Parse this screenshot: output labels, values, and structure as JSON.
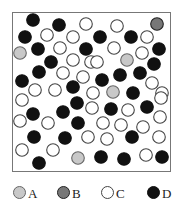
{
  "legend": [
    {
      "key": "A",
      "label": "A",
      "fill": "#c8c8c8",
      "stroke": "#666666"
    },
    {
      "key": "B",
      "label": "B",
      "fill": "#777777",
      "stroke": "#222222"
    },
    {
      "key": "C",
      "label": "C",
      "fill": "#ffffff",
      "stroke": "#444444"
    },
    {
      "key": "D",
      "label": "D",
      "fill": "#111111",
      "stroke": "#111111"
    }
  ],
  "particles": [
    [
      "D",
      33,
      20
    ],
    [
      "D",
      59,
      25
    ],
    [
      "C",
      86,
      24
    ],
    [
      "C",
      117,
      26
    ],
    [
      "B",
      157,
      24
    ],
    [
      "D",
      25,
      37
    ],
    [
      "C",
      47,
      35
    ],
    [
      "C",
      73,
      37
    ],
    [
      "D",
      100,
      37
    ],
    [
      "D",
      131,
      37
    ],
    [
      "C",
      147,
      37
    ],
    [
      "D",
      38,
      49
    ],
    [
      "C",
      60,
      48
    ],
    [
      "D",
      86,
      49
    ],
    [
      "C",
      114,
      48
    ],
    [
      "C",
      142,
      53
    ],
    [
      "D",
      159,
      49
    ],
    [
      "A",
      20,
      53
    ],
    [
      "D",
      51,
      62
    ],
    [
      "C",
      73,
      60
    ],
    [
      "C",
      91,
      62
    ],
    [
      "C",
      97,
      62
    ],
    [
      "A",
      127,
      60
    ],
    [
      "D",
      154,
      64
    ],
    [
      "D",
      39,
      72
    ],
    [
      "C",
      63,
      73
    ],
    [
      "C",
      83,
      77
    ],
    [
      "D",
      120,
      75
    ],
    [
      "D",
      140,
      73
    ],
    [
      "D",
      22,
      81
    ],
    [
      "D",
      102,
      80
    ],
    [
      "C",
      152,
      83
    ],
    [
      "C",
      35,
      90
    ],
    [
      "C",
      55,
      90
    ],
    [
      "D",
      73,
      87
    ],
    [
      "A",
      113,
      92
    ],
    [
      "D",
      133,
      93
    ],
    [
      "C",
      162,
      93
    ],
    [
      "C",
      22,
      100
    ],
    [
      "D",
      77,
      103
    ],
    [
      "C",
      93,
      93
    ],
    [
      "C",
      161,
      98
    ],
    [
      "D",
      33,
      114
    ],
    [
      "D",
      63,
      112
    ],
    [
      "C",
      92,
      108
    ],
    [
      "D",
      111,
      109
    ],
    [
      "C",
      128,
      110
    ],
    [
      "D",
      147,
      107
    ],
    [
      "C",
      20,
      121
    ],
    [
      "C",
      48,
      123
    ],
    [
      "D",
      78,
      123
    ],
    [
      "C",
      103,
      123
    ],
    [
      "C",
      121,
      125
    ],
    [
      "C",
      143,
      127
    ],
    [
      "C",
      160,
      117
    ],
    [
      "D",
      34,
      137
    ],
    [
      "D",
      65,
      138
    ],
    [
      "C",
      88,
      137
    ],
    [
      "C",
      107,
      139
    ],
    [
      "D",
      132,
      137
    ],
    [
      "C",
      159,
      137
    ],
    [
      "C",
      22,
      150
    ],
    [
      "C",
      53,
      150
    ],
    [
      "A",
      78,
      158
    ],
    [
      "D",
      101,
      157
    ],
    [
      "D",
      124,
      159
    ],
    [
      "C",
      146,
      155
    ],
    [
      "D",
      162,
      157
    ],
    [
      "D",
      39,
      163
    ]
  ]
}
